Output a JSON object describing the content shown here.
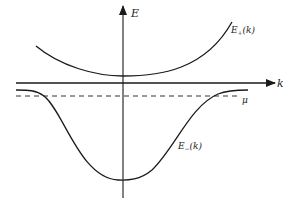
{
  "diagram": {
    "title": "",
    "axes": {
      "vertical_label": "E",
      "horizontal_label": "k"
    },
    "curves": [
      {
        "name": "upper-band",
        "label": "E+(k)",
        "label_main": "E",
        "label_sub": "+",
        "label_arg": "(k)"
      },
      {
        "name": "lower-band",
        "label": "E−(k)",
        "label_main": "E",
        "label_sub": "−",
        "label_arg": "(k)"
      }
    ],
    "reference_line": {
      "label": "μ",
      "style": "dashed"
    },
    "colors": {
      "line": "#1a1a1a",
      "background": "#ffffff"
    }
  }
}
